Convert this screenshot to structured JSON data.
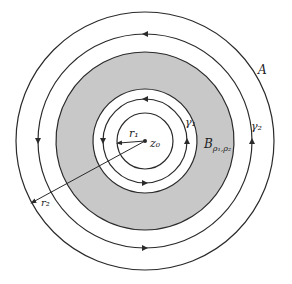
{
  "diagram": {
    "center_label": "z₀",
    "labels": {
      "A": "A",
      "gamma1": "γ₁",
      "gamma2": "γ₂",
      "B": "B",
      "B_sub": "ρ₁,ρ₂",
      "r1": "r₁",
      "r2": "r₂"
    },
    "colors": {
      "stroke": "#2a2a2a",
      "shade": "#c8c8c8",
      "background": "#ffffff"
    },
    "geometry": {
      "center": [
        145,
        141
      ],
      "radii": {
        "outer_A": 129,
        "gamma2": 107,
        "shade_outer": 89,
        "shade_inner": 52,
        "gamma1": 42,
        "inner_r1": 28
      }
    }
  }
}
